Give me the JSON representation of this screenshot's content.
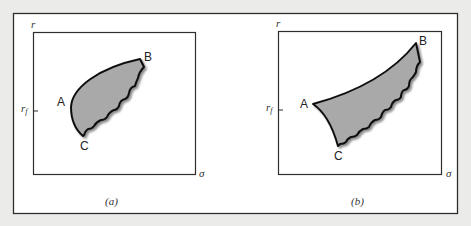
{
  "figure": {
    "colors": {
      "background": "#ebebea",
      "frame": "#2e2e2e",
      "panel": "#ffffff",
      "region_fill": "#a9a9a9",
      "region_stroke": "#111111"
    },
    "panels": [
      {
        "caption": "(a)",
        "y_axis_label": "r",
        "x_axis_label": "σ",
        "rf_label": "r",
        "rf_sub": "f",
        "points": {
          "A": "A",
          "B": "B",
          "C": "C"
        }
      },
      {
        "caption": "(b)",
        "y_axis_label": "r",
        "x_axis_label": "σ",
        "rf_label": "r",
        "rf_sub": "f",
        "points": {
          "A": "A",
          "B": "B",
          "C": "C"
        }
      }
    ]
  }
}
